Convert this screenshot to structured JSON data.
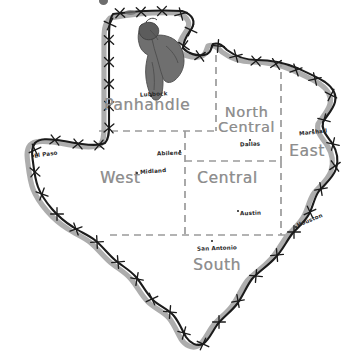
{
  "map": {
    "title": "Texas regions map",
    "style": "hand-drawn barbed wire outline",
    "colors": {
      "wire": "#1b1b1b",
      "wire_shadow": "#a9a9a9",
      "region_divider": "#9a9a9a",
      "region_label": "#8d8d8d",
      "city_label": "#2a2a2a",
      "bat_figure": "#6f6f6f",
      "background": "#ffffff"
    },
    "regions": [
      {
        "name": "panhandle",
        "label": "Panhandle",
        "label_lines": [
          "Panhandle"
        ],
        "x": 104,
        "y": 98,
        "size": "big"
      },
      {
        "name": "north-central",
        "label": "North Central",
        "label_lines": [
          "North",
          "Central"
        ],
        "x": 218,
        "y": 112,
        "size": "two"
      },
      {
        "name": "east",
        "label": "East",
        "label_lines": [
          "East"
        ],
        "x": 289,
        "y": 150,
        "size": "big"
      },
      {
        "name": "west",
        "label": "West",
        "label_lines": [
          "West"
        ],
        "x": 100,
        "y": 172,
        "size": "big"
      },
      {
        "name": "central",
        "label": "Central",
        "label_lines": [
          "Central"
        ],
        "x": 197,
        "y": 172,
        "size": "big"
      },
      {
        "name": "south",
        "label": "South",
        "label_lines": [
          "South"
        ],
        "x": 193,
        "y": 260,
        "size": "big"
      }
    ],
    "cities": [
      {
        "name": "lubbock",
        "label": "Lubbock",
        "x": 140,
        "y": 97,
        "dot_x": 150,
        "dot_y": 95,
        "rotate": 0
      },
      {
        "name": "dallas",
        "label": "Dallas",
        "x": 241,
        "y": 142,
        "dot_x": 248,
        "dot_y": 140,
        "rotate": 0
      },
      {
        "name": "marshall",
        "label": "Marshall",
        "x": 299,
        "y": 131,
        "dot_x": 310,
        "dot_y": 130,
        "rotate": 0
      },
      {
        "name": "el-paso",
        "label": "El Paso",
        "x": 34,
        "y": 155,
        "dot_x": 33,
        "dot_y": 154,
        "rotate": -8
      },
      {
        "name": "abilene",
        "label": "Abilene",
        "x": 158,
        "y": 152,
        "dot_x": 176,
        "dot_y": 151,
        "rotate": 0
      },
      {
        "name": "midland",
        "label": "Midland",
        "x": 140,
        "y": 170,
        "dot_x": 136,
        "dot_y": 172,
        "rotate": 0
      },
      {
        "name": "austin",
        "label": "Austin",
        "x": 240,
        "y": 211,
        "dot_x": 238,
        "dot_y": 211,
        "rotate": 0
      },
      {
        "name": "houston",
        "label": "Houston",
        "x": 296,
        "y": 218,
        "dot_x": 294,
        "dot_y": 224,
        "rotate": -20
      },
      {
        "name": "san-antonio",
        "label": "San Antonio",
        "x": 198,
        "y": 247,
        "dot_x": 211,
        "dot_y": 241,
        "rotate": 0
      }
    ],
    "figure": {
      "name": "bat-hanging-from-wire",
      "description": "dark gray bat-like shape hanging from the barbed wire at the top of the Panhandle"
    }
  }
}
